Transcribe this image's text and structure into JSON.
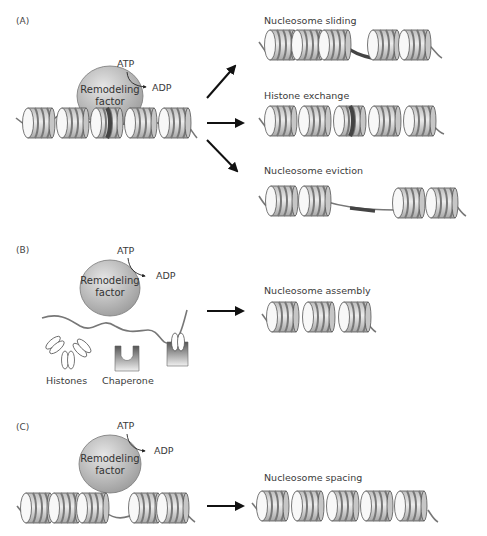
{
  "panels": [
    {
      "id": "A",
      "label": "(A)",
      "factor": {
        "line1": "Remodeling",
        "line2": "factor",
        "atp": "ATP",
        "adp": "ADP"
      },
      "outcomes": [
        {
          "label": "Nucleosome sliding"
        },
        {
          "label": "Histone exchange"
        },
        {
          "label": "Nucleosome eviction"
        }
      ]
    },
    {
      "id": "B",
      "label": "(B)",
      "factor": {
        "line1": "Remodeling",
        "line2": "factor",
        "atp": "ATP",
        "adp": "ADP"
      },
      "histones_label": "Histones",
      "chaperone_label": "Chaperone",
      "outcomes": [
        {
          "label": "Nucleosome assembly"
        }
      ]
    },
    {
      "id": "C",
      "label": "(C)",
      "factor": {
        "line1": "Remodeling",
        "line2": "factor",
        "atp": "ATP",
        "adp": "ADP"
      },
      "outcomes": [
        {
          "label": "Nucleosome spacing"
        }
      ]
    }
  ],
  "colors": {
    "dna": "#777777",
    "factor_fill": "#b8b8b8",
    "nucleosome_fill": "#d9d9d9",
    "nucleosome_band": "#9a9a9a",
    "exchanged_histone": "#555555",
    "arrow": "#111111"
  }
}
